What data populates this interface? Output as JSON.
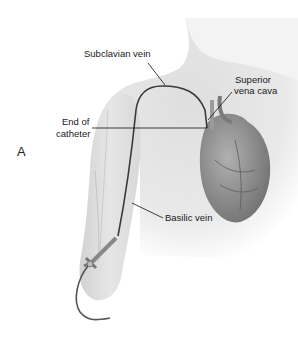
{
  "figure": {
    "panel_label": "A",
    "labels": {
      "subclavian": "Subclavian vein",
      "svc_line1": "Superior",
      "svc_line2": "vena cava",
      "end_line1": "End of",
      "end_line2": "catheter",
      "basilic": "Basilic vein"
    },
    "colors": {
      "skin": "#e4e4e4",
      "skin_shadow": "#c9c9c9",
      "catheter": "#3a3a3a",
      "heart": "#8a8a8a",
      "leader": "#111111"
    }
  }
}
